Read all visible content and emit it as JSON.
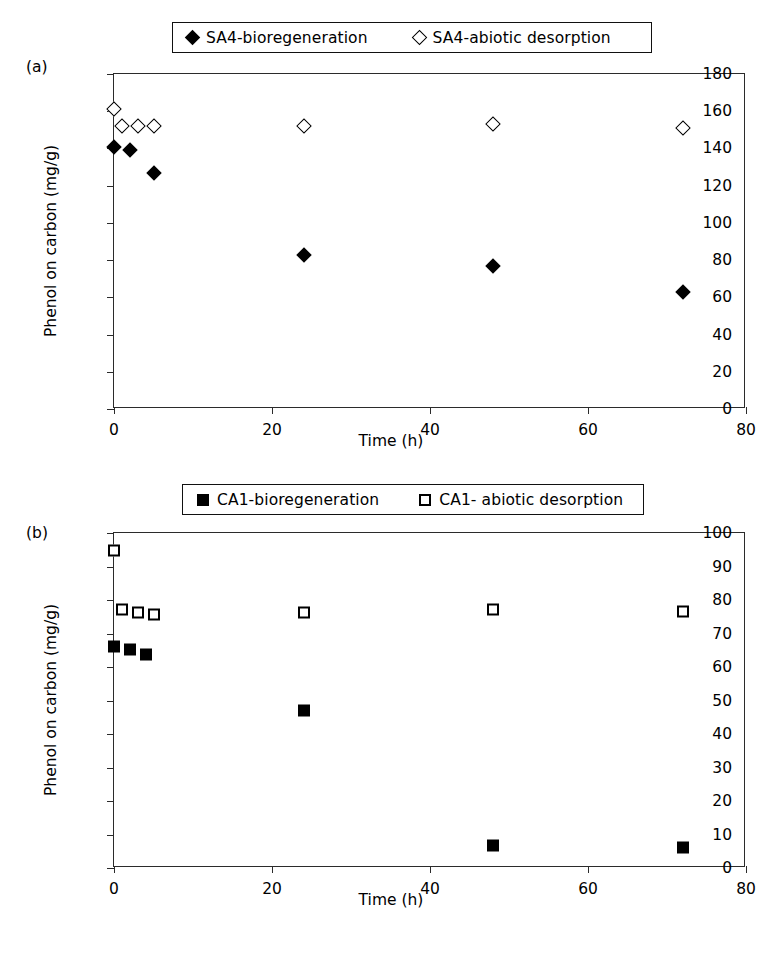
{
  "figure": {
    "panels": [
      {
        "id": "a",
        "label": "(a)",
        "legend": [
          {
            "marker": "diamond-filled",
            "label": "SA4-bioregeneration"
          },
          {
            "marker": "diamond-open",
            "label": "SA4-abiotic desorption"
          }
        ]
      },
      {
        "id": "b",
        "label": "(b)",
        "legend": [
          {
            "marker": "square-filled",
            "label": "CA1-bioregeneration"
          },
          {
            "marker": "square-open",
            "label": "CA1- abiotic desorption"
          }
        ]
      }
    ]
  },
  "chart_data": [
    {
      "type": "scatter",
      "panel": "a",
      "title": "",
      "xlabel": "Time (h)",
      "ylabel": "Phenol on carbon (mg/g)",
      "xlim": [
        0,
        80
      ],
      "ylim": [
        0,
        180
      ],
      "xticks": [
        0,
        20,
        40,
        60,
        80
      ],
      "yticks": [
        0,
        20,
        40,
        60,
        80,
        100,
        120,
        140,
        160,
        180
      ],
      "grid": false,
      "legend_position": "above-plot",
      "series": [
        {
          "name": "SA4-bioregeneration",
          "marker": "diamond-filled",
          "color": "#000000",
          "x": [
            0,
            2,
            5,
            24,
            48,
            72
          ],
          "y": [
            141,
            139,
            127,
            83,
            77,
            63
          ]
        },
        {
          "name": "SA4-abiotic desorption",
          "marker": "diamond-open",
          "color": "#000000",
          "x": [
            0,
            1,
            3,
            5,
            24,
            48,
            72
          ],
          "y": [
            161,
            152,
            152,
            152,
            152,
            153,
            151
          ]
        }
      ]
    },
    {
      "type": "scatter",
      "panel": "b",
      "title": "",
      "xlabel": "Time (h)",
      "ylabel": "Phenol on carbon (mg/g)",
      "xlim": [
        0,
        80
      ],
      "ylim": [
        0,
        100
      ],
      "xticks": [
        0,
        20,
        40,
        60,
        80
      ],
      "yticks": [
        0,
        10,
        20,
        30,
        40,
        50,
        60,
        70,
        80,
        90,
        100
      ],
      "grid": false,
      "legend_position": "above-plot",
      "series": [
        {
          "name": "CA1-bioregeneration",
          "marker": "square-filled",
          "color": "#000000",
          "x": [
            0,
            2,
            4,
            24,
            48,
            72
          ],
          "y": [
            66,
            65,
            63.5,
            47,
            6.5,
            6
          ]
        },
        {
          "name": "CA1- abiotic desorption",
          "marker": "square-open",
          "color": "#000000",
          "x": [
            0,
            1,
            3,
            5,
            24,
            48,
            72
          ],
          "y": [
            94.5,
            77,
            76,
            75.5,
            76,
            77,
            76.5
          ]
        }
      ]
    }
  ]
}
